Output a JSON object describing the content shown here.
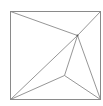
{
  "diagram": {
    "type": "triangulated-square",
    "stroke_color": "#8a8a8a",
    "square": {
      "x1": 10,
      "y1": 11,
      "x2": 100,
      "y2": 99
    },
    "points": {
      "TL": [
        10,
        11
      ],
      "TR": [
        100,
        11
      ],
      "BR": [
        100,
        99
      ],
      "BL": [
        10,
        99
      ],
      "A": [
        77,
        35
      ],
      "B": [
        64,
        75
      ]
    },
    "edges": [
      [
        "TL",
        "A"
      ],
      [
        "TR",
        "A"
      ],
      [
        "BL",
        "A"
      ],
      [
        "A",
        "B"
      ],
      [
        "A",
        "BR"
      ],
      [
        "BL",
        "B"
      ],
      [
        "B",
        "BR"
      ]
    ]
  }
}
